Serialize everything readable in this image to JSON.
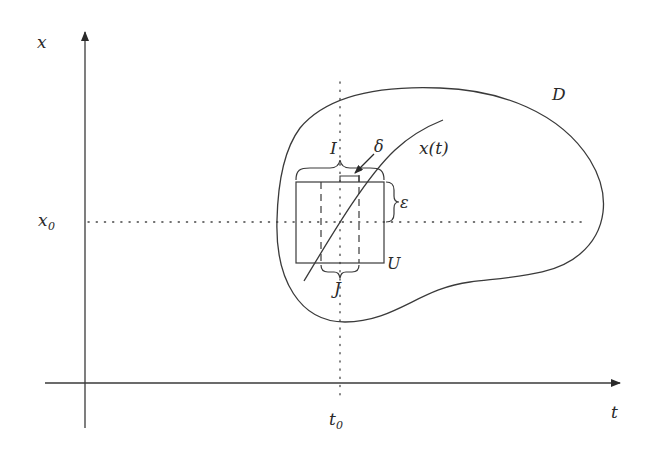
{
  "figure": {
    "axes": {
      "x_axis_label": "t",
      "y_axis_label": "x",
      "x_tick_label": "t",
      "x_tick_sub": "0",
      "y_tick_label": "x",
      "y_tick_sub": "0"
    },
    "labels": {
      "domain": "D",
      "curve_name": "x(t)",
      "interval_I": "I",
      "interval_J": "J",
      "delta": "δ",
      "epsilon": "ε",
      "box": "U"
    },
    "colors": {
      "line": "#3a3a3a",
      "text": "#2a2a2a",
      "background": "#ffffff"
    }
  }
}
